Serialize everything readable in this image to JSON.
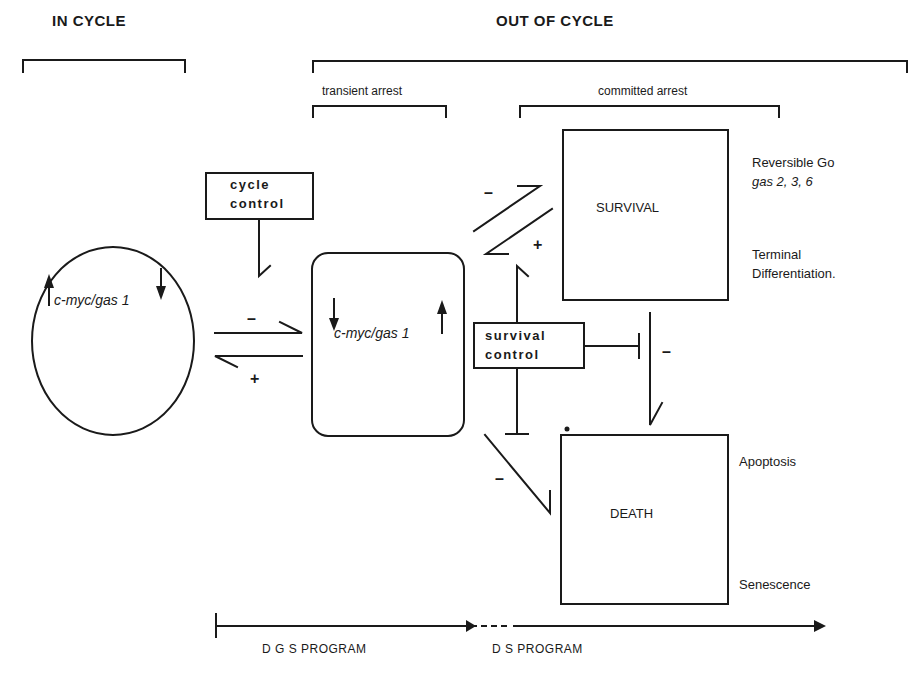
{
  "headers": {
    "in_cycle": "IN      CYCLE",
    "out_of_cycle": "OUT   OF   CYCLE",
    "transient_arrest": "transient  arrest",
    "committed_arrest": "committed arrest"
  },
  "nodes": {
    "cycling_cell": {
      "gene_label": "c-myc/gas 1",
      "c_myc_direction": "up",
      "gas1_direction": "down"
    },
    "arrested_cell": {
      "gene_label": "c-myc/gas 1",
      "c_myc_direction": "down",
      "gas1_direction": "up"
    },
    "cycle_control": {
      "line1": "cycle",
      "line2": "control"
    },
    "survival_control": {
      "line1": "survival",
      "line2": "control"
    },
    "survival": {
      "label": "SURVIVAL"
    },
    "death": {
      "label": "DEATH"
    }
  },
  "annotations": {
    "survival_side": {
      "reversible": "Reversible   Go",
      "gas_genes": "gas 2, 3, 6",
      "terminal_line1": "Terminal",
      "terminal_line2": "Differentiation."
    },
    "death_side": {
      "apoptosis": "Apoptosis",
      "senescence": "Senescence"
    }
  },
  "signs": {
    "forward_arrest": "–",
    "reverse_arrest": "+",
    "to_survival_upper": "–",
    "to_survival_lower": "+",
    "survival_to_death": "–",
    "arrest_to_death": "–"
  },
  "programs": {
    "dgs": "D G S  PROGRAM",
    "ds": "D S   PROGRAM"
  },
  "colors": {
    "ink": "#1a1a1a",
    "background": "#ffffff"
  }
}
